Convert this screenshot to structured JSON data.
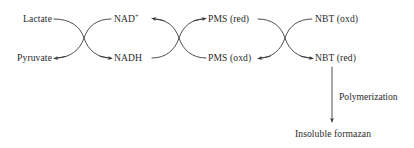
{
  "diagram": {
    "type": "reaction-cycle-diagram",
    "background_color": "#ffffff",
    "stroke_color": "#3a3a3a",
    "text_color": "#2b2b2b",
    "nodes": {
      "lactate": "Lactate",
      "pyruvate": "Pyruvate",
      "nad_plus_base": "NAD",
      "nad_plus_sup": "+",
      "nadh": "NADH",
      "pms_red": "PMS (red)",
      "pms_oxd": "PMS (oxd)",
      "nbt_oxd": "NBT (oxd)",
      "nbt_red": "NBT (red)",
      "insoluble_formazan": "Insoluble formazan"
    },
    "edge_labels": {
      "polymerization": "Polymerization"
    }
  }
}
